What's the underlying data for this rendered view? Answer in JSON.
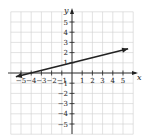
{
  "chart_data": {
    "type": "line",
    "title": "",
    "xlabel": "x",
    "ylabel": "y",
    "xlim": [
      -6,
      6
    ],
    "ylim": [
      -6,
      6
    ],
    "grid": true,
    "x_tick_labels": [
      "−5",
      "−4",
      "−3",
      "−2",
      "−1",
      "1",
      "2",
      "3",
      "4",
      "5"
    ],
    "y_tick_labels": [
      "5",
      "4",
      "3",
      "2",
      "1",
      "−1",
      "−2",
      "−3",
      "−4",
      "−5"
    ],
    "series": [
      {
        "name": "line",
        "equation": "y = x/4 + 1",
        "x": [
          -5.5,
          5.5
        ],
        "y": [
          -0.375,
          2.375
        ],
        "arrows": "both",
        "color": "#222222"
      }
    ]
  }
}
